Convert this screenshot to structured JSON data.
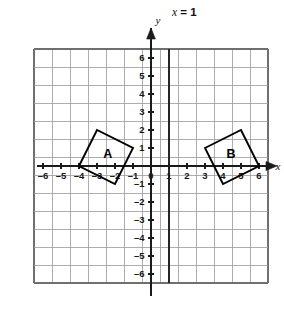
{
  "figure": {
    "background_color": "#ffffff",
    "grid_color": "#9a9a9a",
    "axis_color": "#1a1a1a",
    "shape_color": "#000000"
  },
  "chart_data": {
    "type": "scatter",
    "title": "",
    "xlabel": "x",
    "ylabel": "y",
    "xlim": [
      -6.5,
      6.5
    ],
    "ylim": [
      -6.5,
      6.5
    ],
    "grid": true,
    "legend": "none",
    "x_ticks": [
      -6,
      -5,
      -4,
      -3,
      -2,
      -1,
      0,
      1,
      2,
      3,
      4,
      5,
      6
    ],
    "y_ticks": [
      -6,
      -5,
      -4,
      -3,
      -2,
      -1,
      0,
      1,
      2,
      3,
      4,
      5,
      6
    ],
    "x_tick_labels": [
      "–6",
      "–5",
      "–4",
      "–3",
      "–2",
      "–1",
      "0",
      "1",
      "2",
      "3",
      "4",
      "5",
      "6"
    ],
    "y_tick_labels": [
      "–6",
      "–5",
      "–4",
      "–3",
      "–2",
      "–1",
      "0",
      "1",
      "2",
      "3",
      "4",
      "5",
      "6"
    ],
    "annotations": [
      {
        "name": "mirror-line",
        "text": "x = 1",
        "x": 1,
        "y": 6.6
      },
      {
        "name": "x-axis-name",
        "text": "x",
        "x": 6.55,
        "y": 0.25
      },
      {
        "name": "y-axis-name",
        "text": "y",
        "x": 0.45,
        "y": 6.35
      }
    ],
    "series": [
      {
        "name": "A",
        "type": "polygon",
        "label": "A",
        "label_x": -2.4,
        "label_y": 0.72,
        "closed": true,
        "points": [
          [
            -4,
            0
          ],
          [
            -3,
            2
          ],
          [
            -1,
            1
          ],
          [
            -2,
            -1
          ]
        ]
      },
      {
        "name": "B",
        "type": "polygon",
        "label": "B",
        "label_x": 4.45,
        "label_y": 0.72,
        "closed": true,
        "points": [
          [
            3,
            1
          ],
          [
            5,
            2
          ],
          [
            6,
            0
          ],
          [
            4,
            -1
          ]
        ]
      }
    ],
    "reference_lines": [
      {
        "name": "x-equals-1",
        "orientation": "vertical",
        "value": 1,
        "label": "x = 1"
      }
    ]
  },
  "labels": {
    "mirror_line_var": "x",
    "mirror_line_rest": " = 1",
    "x_axis_name": "x",
    "y_axis_name": "y",
    "shape_a": "A",
    "shape_b": "B"
  },
  "ticks": {
    "x": [
      "–6",
      "–5",
      "–4",
      "–3",
      "–2",
      "–1",
      "0",
      "1",
      "2",
      "3",
      "4",
      "5",
      "6"
    ],
    "y_above": [
      "6",
      "5",
      "4",
      "3",
      "2",
      "1"
    ],
    "y_zero": "0",
    "y_below": [
      "–1",
      "–2",
      "–3",
      "–4",
      "–5",
      "–6"
    ]
  }
}
